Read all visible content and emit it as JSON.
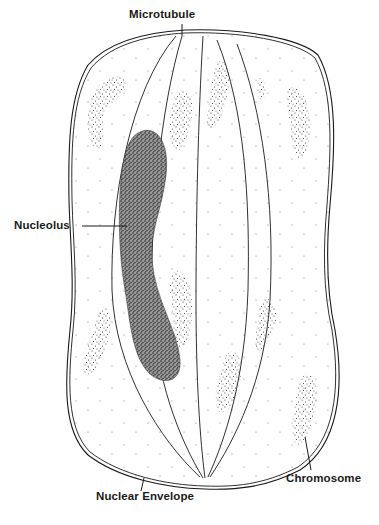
{
  "diagram": {
    "labels": {
      "microtubule": "Microtubule",
      "nucleolus": "Nucleolus",
      "chromosome": "Chromosome",
      "nuclear_envelope": "Nuclear Envelope"
    },
    "colors": {
      "ink": "#1a1a1a",
      "stipple": "#3a3a3a",
      "background": "#ffffff"
    }
  }
}
